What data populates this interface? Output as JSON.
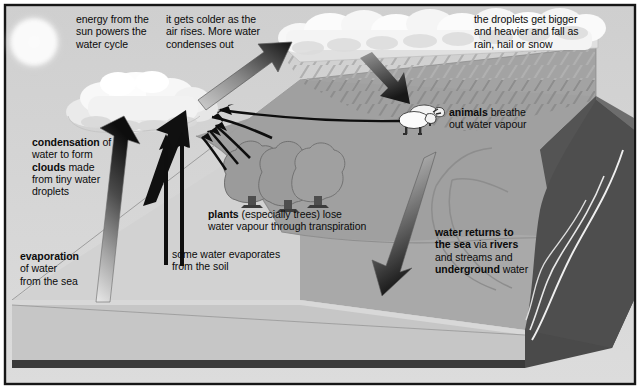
{
  "diagram": {
    "title": "The Water Cycle",
    "frame": {
      "border_color": "#1a1a1a",
      "sky_color": "#cfcfcf",
      "land_color": "#a9a9a9"
    },
    "labels": {
      "sun_energy": "energy from the\nsun powers the\nwater cycle",
      "colder_air": "it gets colder as the\nair rises. More water\ncondenses out",
      "droplets_fall": "the droplets get bigger\nand heavier and fall as\nrain, hail or snow",
      "animals_plain": " breathe\nout water vapour",
      "animals_bold": "animals",
      "condensation_line1_bold": "condensation",
      "condensation_line1_rest": " of",
      "condensation_line2": "water to form",
      "condensation_line3_bold": "clouds",
      "condensation_line3_rest": " made",
      "condensation_line4": "from tiny water",
      "condensation_line5": "droplets",
      "evaporation_bold": "evaporation",
      "evaporation_rest": "of water\nfrom the sea",
      "soil_evap": "some water evaporates\nfrom the soil",
      "plants_bold": "plants",
      "plants_rest": " (especially trees) lose\nwater vapour through transpiration",
      "returns_l1_bold": "water returns to",
      "returns_l2_bold": "the sea",
      "returns_l2_mid": " via ",
      "returns_l2_bold2": "rivers",
      "returns_l3": "and streams and",
      "returns_l4_bold": "underground",
      "returns_l4_rest": " water"
    },
    "icons": {
      "sun": "sun-icon",
      "cloud_left": "cloud-icon",
      "cloud_rain": "rain-cloud-icon",
      "sheep": "sheep-icon",
      "trees": "tree-icon",
      "arrow_evaporation": "up-arrow-gradient-icon",
      "arrow_condensation": "up-arrow-icon",
      "arrow_rising_air": "diagonal-up-arrow-icon",
      "arrow_rainfall": "down-arrow-icon",
      "arrow_river": "down-arrow-icon",
      "arrow_transpiration": "curved-up-arrow-icon",
      "arrow_animal_vapour": "straight-line-arrow-icon",
      "river_channel": "river-line-icon"
    },
    "colors": {
      "sky": "#cecece",
      "land_top": "#a8a8a8",
      "land_light": "#d3d3d3",
      "sea_top": "#d8d8d8",
      "sea_side": "#bdbdbd",
      "mountain_dark": "#4c4c4c",
      "soil_patch": "#9b9b9b",
      "tree_fill": "#9a9a9a",
      "arrow_black": "#101010",
      "cloud_white": "#f6f6f6",
      "border": "#161616"
    }
  }
}
